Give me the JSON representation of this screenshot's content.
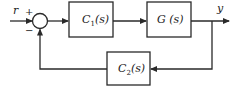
{
  "diagram": {
    "type": "block-diagram",
    "signals": {
      "input": "r",
      "output": "y"
    },
    "summing_junction": {
      "plus_sign": "+",
      "minus_sign": "−"
    },
    "blocks": [
      {
        "id": "c1",
        "name": "C",
        "subscript": "1",
        "arg": "(s)",
        "position": "forward-1"
      },
      {
        "id": "g",
        "name": "G",
        "subscript": "",
        "arg": " (s)",
        "position": "forward-2"
      },
      {
        "id": "c2",
        "name": "C",
        "subscript": "2",
        "arg": "(s)",
        "position": "feedback"
      }
    ],
    "connections": [
      {
        "from": "r",
        "to": "sum",
        "sign": "+"
      },
      {
        "from": "sum",
        "to": "c1"
      },
      {
        "from": "c1",
        "to": "g"
      },
      {
        "from": "g",
        "to": "y"
      },
      {
        "from": "y",
        "to": "c2"
      },
      {
        "from": "c2",
        "to": "sum",
        "sign": "−"
      }
    ],
    "colors": {
      "line": "#2a2a2a",
      "background": "#ffffff"
    }
  }
}
